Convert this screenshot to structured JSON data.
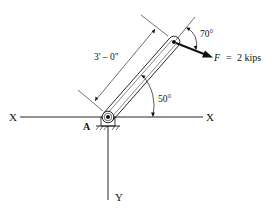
{
  "figure": {
    "axis_x_left_label": "X",
    "axis_x_right_label": "X",
    "axis_y_label": "Y",
    "pivot_label": "A",
    "length_label": "3' – 0\"",
    "member_angle_label": "50°",
    "force_angle_label": "70°",
    "force_symbol": "F",
    "force_equals": "=",
    "force_value": "2 kips",
    "colors": {
      "ink": "#111111",
      "background": "#ffffff"
    }
  }
}
